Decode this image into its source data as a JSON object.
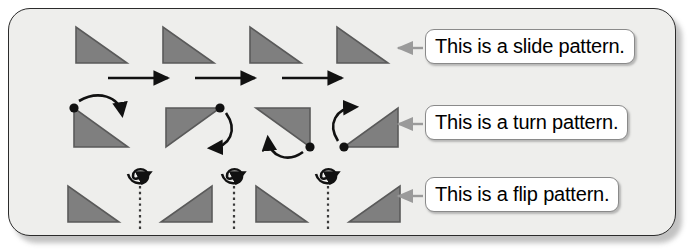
{
  "panel": {
    "background_color": "#eeeeec",
    "border_color": "#2b2b2b",
    "corner_radius": 22
  },
  "colors": {
    "triangle_fill": "#7f7f7f",
    "triangle_stroke": "#5a5a5a",
    "arrow_black": "#111111",
    "pointer_gray": "#9a9a9a",
    "label_border": "#8a8a8a",
    "label_background": "#ffffff",
    "dotted_line": "#3a3a3a"
  },
  "labels": {
    "slide": "This is a slide pattern.",
    "turn": "This is a turn pattern.",
    "flip": "This is a flip pattern."
  },
  "rows": [
    {
      "name": "slide",
      "transformation": "slide",
      "label": "This is a slide pattern.",
      "shape_count": 4,
      "connector_count": 3,
      "connector_type": "straight-right-arrow",
      "shapes": [
        {
          "orientation": "right-angle-top-left"
        },
        {
          "orientation": "right-angle-top-left"
        },
        {
          "orientation": "right-angle-top-left"
        },
        {
          "orientation": "right-angle-top-left"
        }
      ]
    },
    {
      "name": "turn",
      "transformation": "turn",
      "label": "This is a turn pattern.",
      "shape_count": 4,
      "connector_count": 4,
      "connector_type": "curved-rotation-arrow",
      "rotation_degrees": 90,
      "shapes": [
        {
          "orientation": "right-angle-top-left",
          "pivot": "top-left"
        },
        {
          "orientation": "right-angle-bottom-left",
          "pivot": "top-right"
        },
        {
          "orientation": "right-angle-top-left",
          "pivot": "bottom-right"
        },
        {
          "orientation": "right-angle-bottom-right",
          "pivot": "bottom-left"
        }
      ]
    },
    {
      "name": "flip",
      "transformation": "flip",
      "label": "This is a flip pattern.",
      "shape_count": 4,
      "connector_count": 3,
      "connector_type": "loop-flip-arrow",
      "axis_style": "dotted-vertical",
      "shapes": [
        {
          "orientation": "right-angle-top-left"
        },
        {
          "orientation": "right-angle-top-right"
        },
        {
          "orientation": "right-angle-top-left"
        },
        {
          "orientation": "right-angle-top-right"
        }
      ]
    }
  ],
  "pointers": [
    {
      "target_row": "slide",
      "direction": "left"
    },
    {
      "target_row": "turn",
      "direction": "left"
    },
    {
      "target_row": "flip",
      "direction": "left"
    }
  ]
}
